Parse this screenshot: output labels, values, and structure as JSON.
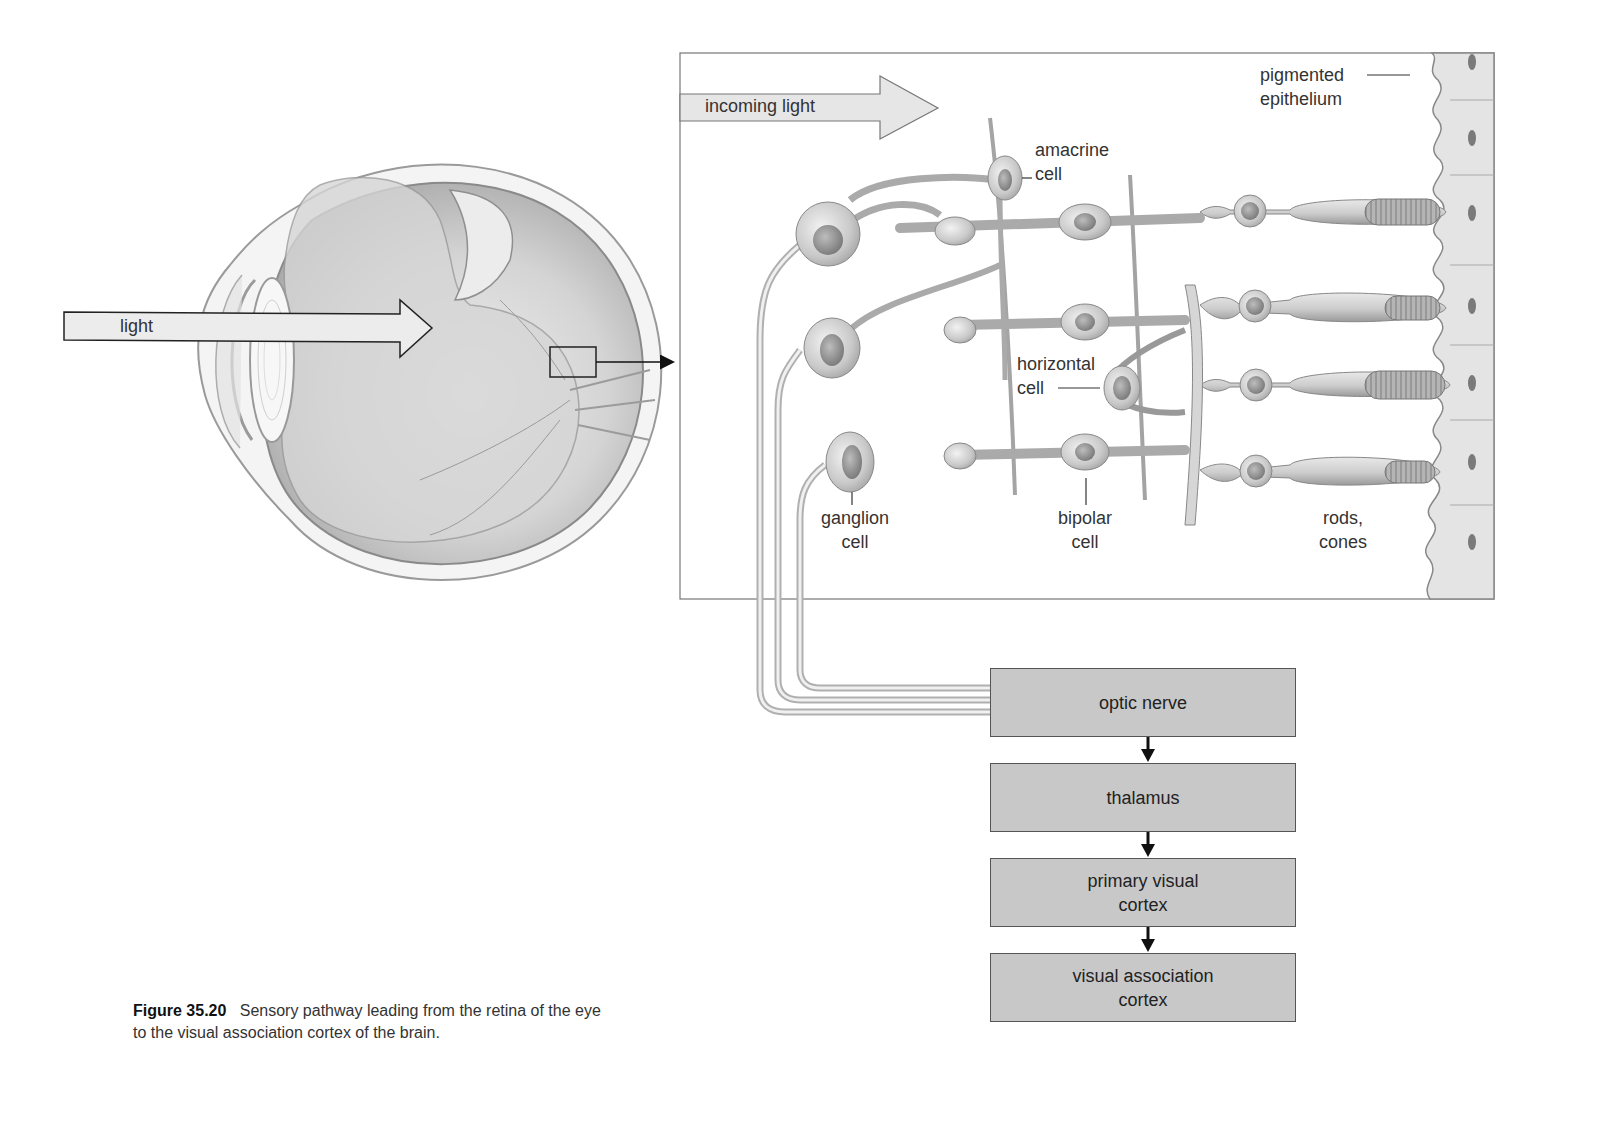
{
  "figure": {
    "number": "Figure 35.20",
    "caption_line1": "Sensory pathway leading from the retina of the eye",
    "caption_line2": "to the visual association cortex of the brain."
  },
  "eye_diagram": {
    "arrow_label": "light"
  },
  "retina_inset": {
    "arrow_label": "incoming light",
    "labels": {
      "pigmented_epithelium_1": "pigmented",
      "pigmented_epithelium_2": "epithelium",
      "amacrine_1": "amacrine",
      "amacrine_2": "cell",
      "horizontal_1": "horizontal",
      "horizontal_2": "cell",
      "ganglion_1": "ganglion",
      "ganglion_2": "cell",
      "bipolar_1": "bipolar",
      "bipolar_2": "cell",
      "rods_cones_1": "rods,",
      "rods_cones_2": "cones"
    }
  },
  "pathway": {
    "steps": [
      {
        "label_1": "optic nerve",
        "label_2": ""
      },
      {
        "label_1": "thalamus",
        "label_2": ""
      },
      {
        "label_1": "primary visual",
        "label_2": "cortex"
      },
      {
        "label_1": "visual association",
        "label_2": "cortex"
      }
    ]
  },
  "colors": {
    "box_fill": "#c8c8c8",
    "arrow_fill": "#e6e6e6",
    "cell_fill": "#d9d9d9",
    "epithelium_fill": "#e4e4e4",
    "outline": "#555555"
  }
}
